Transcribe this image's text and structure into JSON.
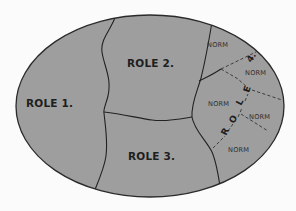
{
  "diagram": {
    "shape": "ellipse",
    "colors": {
      "fill": "#9e9e9e",
      "outline": "#2a2a2a",
      "background": "#fbfbfb",
      "text": "#1e1e1e"
    },
    "regions": [
      {
        "id": "role1",
        "label": "ROLE 1."
      },
      {
        "id": "role2",
        "label": "ROLE 2."
      },
      {
        "id": "role3",
        "label": "ROLE 3."
      }
    ],
    "role4": {
      "letters": [
        "R",
        "O",
        "L",
        "E",
        "4."
      ],
      "norms": [
        "NORM",
        "NORM",
        "NORM",
        "NORM",
        "NORM"
      ]
    }
  }
}
